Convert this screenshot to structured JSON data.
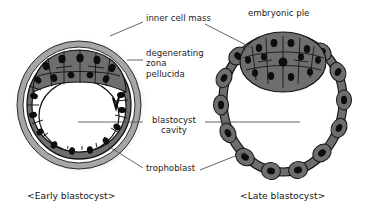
{
  "diagram": {
    "title_present": false,
    "colors": {
      "cell_fill": "#6e6e6e",
      "cell_fill_dark": "#5d5d5d",
      "nucleus": "#0d0d0d",
      "outline": "#151515",
      "zona": "#a8a8a8",
      "halo": "#c9c9c9",
      "cavity": "#ffffff",
      "leader_line": "#4a4a4a",
      "text": "#1d1d1d",
      "background": "#ffffff"
    },
    "labels": [
      {
        "id": "inner-cell-mass",
        "text": "inner cell mass",
        "x": 146,
        "y": 17,
        "align": "left"
      },
      {
        "id": "degenerating-zona-pellucida",
        "text": "degenerating\nzona\npellucida",
        "x": 146,
        "y": 52,
        "align": "left"
      },
      {
        "id": "blastocyst-cavity",
        "text": "blastocyst\ncavity",
        "x": 148,
        "y": 118,
        "align": "center"
      },
      {
        "id": "trophoblast",
        "text": "trophoblast",
        "x": 146,
        "y": 166,
        "align": "left"
      },
      {
        "id": "embryonic-pole",
        "text": "embryonic ple",
        "x": 248,
        "y": 11,
        "align": "left"
      }
    ],
    "captions": [
      {
        "id": "early-blastocyst-caption",
        "text": "<Early blastocyst>",
        "x": 27,
        "y": 192
      },
      {
        "id": "late-blastocyst-caption",
        "text": "<Late blastocyst>",
        "x": 240,
        "y": 192
      }
    ],
    "figures": [
      {
        "id": "early-blastocyst",
        "caption": "<Early blastocyst>",
        "center": [
          79,
          105
        ],
        "structures": [
          "zona pellucida",
          "trophoblast",
          "inner cell mass",
          "blastocyst cavity"
        ]
      },
      {
        "id": "late-blastocyst",
        "caption": "<Late blastocyst>",
        "center": [
          283,
          105
        ],
        "structures": [
          "trophoblast",
          "inner cell mass",
          "blastocyst cavity",
          "embryonic pole"
        ]
      }
    ]
  }
}
